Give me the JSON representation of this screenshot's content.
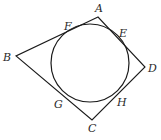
{
  "diagram": {
    "colors": {
      "stroke": "#1a1a1a",
      "label": "#2a2a2a",
      "background": "#ffffff"
    },
    "vertices": {
      "A": {
        "label": "A",
        "x": 98,
        "y": 17
      },
      "B": {
        "label": "B",
        "x": 16,
        "y": 56
      },
      "C": {
        "label": "C",
        "x": 92,
        "y": 120
      },
      "D": {
        "label": "D",
        "x": 145,
        "y": 67
      }
    },
    "circle": {
      "cx": 90,
      "cy": 63,
      "r": 39
    },
    "tangent_points": {
      "F": {
        "label": "F"
      },
      "E": {
        "label": "E"
      },
      "G": {
        "label": "G"
      },
      "H": {
        "label": "H"
      }
    },
    "labels": {
      "A": "A",
      "B": "B",
      "C": "C",
      "D": "D",
      "E": "E",
      "F": "F",
      "G": "G",
      "H": "H"
    }
  }
}
